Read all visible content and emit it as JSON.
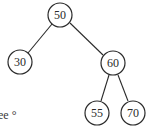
{
  "diagram": {
    "type": "binary-search-tree",
    "nodes": [
      {
        "id": "n50",
        "label": "50",
        "x": 60,
        "y": 15
      },
      {
        "id": "n30",
        "label": "30",
        "x": 20,
        "y": 62
      },
      {
        "id": "n60",
        "label": "60",
        "x": 113,
        "y": 63
      },
      {
        "id": "n55",
        "label": "55",
        "x": 97,
        "y": 113
      },
      {
        "id": "n70",
        "label": "70",
        "x": 133,
        "y": 113
      }
    ],
    "edges": [
      {
        "from": "n50",
        "to": "n30"
      },
      {
        "from": "n50",
        "to": "n60"
      },
      {
        "from": "n60",
        "to": "n55"
      },
      {
        "from": "n60",
        "to": "n70"
      }
    ],
    "caption": "ee °"
  }
}
